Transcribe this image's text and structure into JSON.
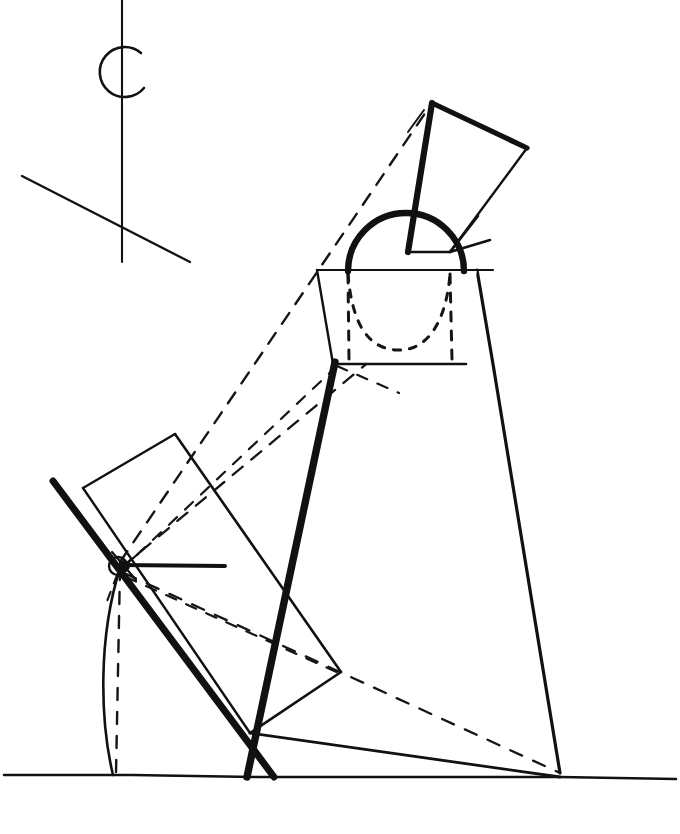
{
  "figure": {
    "kind": "technical-line-drawing",
    "canvas": {
      "width": 680,
      "height": 834
    },
    "colors": {
      "ink": "#111111",
      "paper": "#ffffff",
      "construction": "#1a1a1a"
    },
    "stroke_widths": {
      "hairline": 1.6,
      "thin": 2.0,
      "medium": 3.0,
      "thick": 6.0,
      "heavy": 7.5
    },
    "dash_patterns": {
      "long_dash": "13 11",
      "short_dash": "9 9",
      "dotted_arc": "7 8"
    }
  },
  "annotations": {
    "top_marker_label": "C",
    "ground_label": "",
    "pivot_label": ""
  },
  "elements": {
    "ground_line": {
      "name": "ground-line",
      "points": "4,775 132,775 254,777 452,777 560,777 676,779"
    },
    "top_marker": {
      "name": "c-marker",
      "vertical_axis": "122,0 122,262",
      "circle": {
        "cx": 121,
        "cy": 70,
        "r": 25,
        "dash": "120 38",
        "rotation": -28
      },
      "cross_line": "22,176 190,262"
    },
    "upper_quad": {
      "name": "upper-rigid-body",
      "outline": "432,103 527,148 490,238 450,252 408,252",
      "edges": [
        {
          "from": "432,103",
          "to": "527,148",
          "weight": "thick"
        },
        {
          "from": "527,148",
          "to": "450,252",
          "weight": "thin"
        },
        {
          "from": "450,252",
          "to": "408,252",
          "weight": "thin"
        },
        {
          "from": "408,252",
          "to": "432,103",
          "weight": "thick"
        }
      ],
      "inner_vee": "450,252 478,218 497,268"
    },
    "bucket": {
      "name": "bucket-trapezoid",
      "outline": "317,270 477,270 462,364 333,364",
      "handle_arc": {
        "d": "M 348,271 A 58 58 0 0 1 464,271",
        "weight": "thick"
      },
      "hidden_arc": {
        "d": "M 348,272 C 352,322 368,346 396,348 C 426,350 446,322 450,272",
        "dash": "7 8"
      },
      "hidden_left_edge": "348,272 348,362",
      "hidden_right_edge": "450,272 450,362"
    },
    "main_thick_bar": {
      "name": "main-boom-thick-bar",
      "path": "335,362 247,777",
      "weight": "heavy"
    },
    "right_outer_edge": {
      "name": "right-outer-edge",
      "path": "477,270 493,362 560,777",
      "weight": "medium"
    },
    "bottom_right_tie": {
      "name": "bottom-right-tie-line",
      "path": "250,733 560,777",
      "weight": "thin"
    },
    "lower_quad": {
      "name": "lower-rigid-body",
      "outline": "83,488 175,434 339,670 308,705 250,733",
      "edges": [
        {
          "from": "83,488",
          "to": "175,434",
          "weight": "thin"
        },
        {
          "from": "175,434",
          "to": "339,670",
          "weight": "thin"
        },
        {
          "from": "339,670",
          "to": "250,733",
          "weight": "thin"
        },
        {
          "from": "250,733",
          "to": "83,488",
          "weight": "thin"
        }
      ]
    },
    "lower_thick_bar": {
      "name": "lower-boom-thick-bar",
      "path": "53,481 274,777",
      "weight": "heavy"
    },
    "pivot": {
      "name": "pivot-joint",
      "x": 120,
      "y": 565,
      "radius": 9,
      "hub_radius": 5
    },
    "pivot_horizontal_ray": {
      "name": "pivot-horizontal-reference",
      "path": "120,565 225,566",
      "weight": "medium"
    },
    "swing_arc": {
      "name": "swing-arc",
      "d": "M 120,566 C 98,636 100,718 113,775",
      "weight": "thin"
    },
    "plumb_dashed": {
      "name": "plumb-dashed-line",
      "path": "120,566 116,775",
      "dash": "12 12"
    },
    "construction_lines": [
      {
        "name": "construction-to-upper-apex",
        "path": "120,562 432,103",
        "dash": "13 11"
      },
      {
        "name": "construction-to-bucket-right",
        "path": "122,567 477,272",
        "dash": "13 11"
      },
      {
        "name": "construction-to-bucket-left",
        "path": "121,570 335,364",
        "dash": "11 11"
      },
      {
        "name": "construction-to-ground-right",
        "path": "124,573 560,775",
        "dash": "13 12"
      },
      {
        "name": "construction-through-body",
        "path": "126,577 339,672",
        "dash": "11 11"
      },
      {
        "name": "construction-lower-left",
        "path": "118,574 108,600",
        "dash": "9 9"
      }
    ]
  }
}
